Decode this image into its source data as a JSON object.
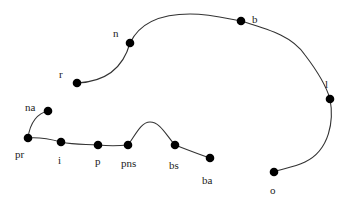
{
  "diagram": {
    "type": "tree-path-graph",
    "nodes": [
      {
        "id": "r",
        "label": "r",
        "x": 77,
        "y": 83,
        "lx": 59,
        "ly": 78
      },
      {
        "id": "n",
        "label": "n",
        "x": 130,
        "y": 43,
        "lx": 113,
        "ly": 37
      },
      {
        "id": "b",
        "label": "b",
        "x": 241,
        "y": 21,
        "lx": 252,
        "ly": 23
      },
      {
        "id": "l",
        "label": "l",
        "x": 330,
        "y": 99,
        "lx": 325,
        "ly": 88
      },
      {
        "id": "o",
        "label": "o",
        "x": 274,
        "y": 172,
        "lx": 270,
        "ly": 194
      },
      {
        "id": "na",
        "label": "na",
        "x": 48,
        "y": 111,
        "lx": 25,
        "ly": 111
      },
      {
        "id": "pr",
        "label": "pr",
        "x": 28,
        "y": 138,
        "lx": 15,
        "ly": 158
      },
      {
        "id": "i",
        "label": "i",
        "x": 61,
        "y": 142,
        "lx": 58,
        "ly": 164
      },
      {
        "id": "p",
        "label": "p",
        "x": 98,
        "y": 145,
        "lx": 95,
        "ly": 165
      },
      {
        "id": "pns",
        "label": "pns",
        "x": 128,
        "y": 145,
        "lx": 121,
        "ly": 167
      },
      {
        "id": "bs",
        "label": "bs",
        "x": 175,
        "y": 145,
        "lx": 169,
        "ly": 169
      },
      {
        "id": "ba",
        "label": "ba",
        "x": 210,
        "y": 158,
        "lx": 202,
        "ly": 184
      }
    ],
    "edges": [
      {
        "from": "r",
        "to": "n",
        "path": "M77,83 C100,82 122,72 130,43"
      },
      {
        "from": "n",
        "to": "b",
        "path": "M130,43 C142,18 170,14 190,14 C210,14 225,18 241,21"
      },
      {
        "from": "b",
        "to": "l",
        "path": "M241,21 C270,30 292,36 305,55 C318,72 326,85 330,99"
      },
      {
        "from": "l",
        "to": "o",
        "path": "M330,99 C334,120 330,150 305,162 C292,168 280,169 274,172"
      },
      {
        "from": "pr",
        "to": "na",
        "path": "M28,138 C30,122 38,113 48,111"
      },
      {
        "from": "pr",
        "to": "i",
        "path": "M28,138 C40,137 50,139 61,142"
      },
      {
        "from": "i",
        "to": "p",
        "path": "M61,142 C75,145 85,144 98,145"
      },
      {
        "from": "p",
        "to": "pns",
        "path": "M98,145 C108,146 118,146 128,145"
      },
      {
        "from": "pns",
        "to": "bs",
        "path": "M128,145 C136,134 141,122 150,122 C160,122 166,135 175,145"
      },
      {
        "from": "bs",
        "to": "ba",
        "path": "M175,145 C188,150 198,154 210,158"
      }
    ],
    "colors": {
      "node": "#000000",
      "edge": "#333333",
      "label": "#222222",
      "background": "#ffffff"
    }
  }
}
